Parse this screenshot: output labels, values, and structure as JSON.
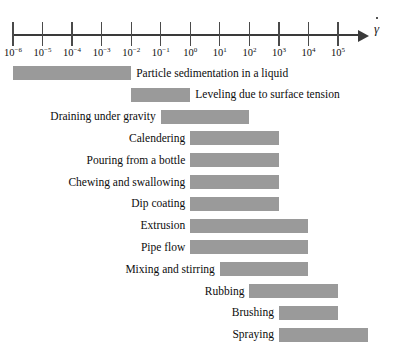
{
  "figure": {
    "axis": {
      "symbol_base": "γ",
      "symbol_name": "gamma-dot-shear-rate",
      "tick_mantissa": "10",
      "ticks": [
        {
          "exponent": "−6",
          "value": 1e-06
        },
        {
          "exponent": "−5",
          "value": 1e-05
        },
        {
          "exponent": "−4",
          "value": 0.0001
        },
        {
          "exponent": "−3",
          "value": 0.001
        },
        {
          "exponent": "−2",
          "value": 0.01
        },
        {
          "exponent": "−1",
          "value": 0.1
        },
        {
          "exponent": "0",
          "value": 1
        },
        {
          "exponent": "1",
          "value": 10
        },
        {
          "exponent": "2",
          "value": 100
        },
        {
          "exponent": "3",
          "value": 1000
        },
        {
          "exponent": "4",
          "value": 10000
        },
        {
          "exponent": "5",
          "value": 100000
        }
      ]
    }
  },
  "chart_data": {
    "type": "bar",
    "orientation": "horizontal-range",
    "title": "",
    "xlabel": "γ̇",
    "ylabel": "",
    "xscale": "log10",
    "xlim": [
      1e-06,
      100000.0
    ],
    "grid": false,
    "legend": null,
    "bar_color": "#9a9a9a",
    "categories": [
      "Particle sedimentation in a liquid",
      "Leveling due to surface tension",
      "Draining under gravity",
      "Calendering",
      "Pouring from a bottle",
      "Chewing and swallowing",
      "Dip coating",
      "Extrusion",
      "Pipe flow",
      "Mixing and stirring",
      "Rubbing",
      "Brushing",
      "Spraying"
    ],
    "ranges": [
      {
        "label": "Particle sedimentation in a liquid",
        "x_start": 1e-06,
        "x_end": 0.01,
        "label_side": "right"
      },
      {
        "label": "Leveling due to surface tension",
        "x_start": 0.01,
        "x_end": 1.0,
        "label_side": "right"
      },
      {
        "label": "Draining under gravity",
        "x_start": 0.1,
        "x_end": 100.0,
        "label_side": "left"
      },
      {
        "label": "Calendering",
        "x_start": 1.0,
        "x_end": 1000.0,
        "label_side": "left"
      },
      {
        "label": "Pouring from a bottle",
        "x_start": 1.0,
        "x_end": 1000.0,
        "label_side": "left"
      },
      {
        "label": "Chewing and swallowing",
        "x_start": 1.0,
        "x_end": 1000.0,
        "label_side": "left"
      },
      {
        "label": "Dip coating",
        "x_start": 1.0,
        "x_end": 1000.0,
        "label_side": "left"
      },
      {
        "label": "Extrusion",
        "x_start": 1.0,
        "x_end": 10000.0,
        "label_side": "left"
      },
      {
        "label": "Pipe flow",
        "x_start": 1.0,
        "x_end": 10000.0,
        "label_side": "left"
      },
      {
        "label": "Mixing and stirring",
        "x_start": 10.0,
        "x_end": 10000.0,
        "label_side": "left"
      },
      {
        "label": "Rubbing",
        "x_start": 100.0,
        "x_end": 100000.0,
        "label_side": "left"
      },
      {
        "label": "Brushing",
        "x_start": 1000.0,
        "x_end": 100000.0,
        "label_side": "left"
      },
      {
        "label": "Spraying",
        "x_start": 1000.0,
        "x_end": 1000000.0,
        "label_side": "left"
      }
    ]
  }
}
